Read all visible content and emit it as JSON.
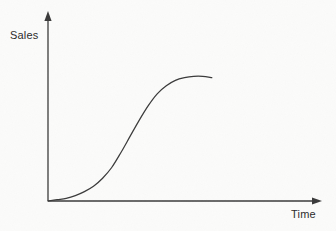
{
  "figure": {
    "background_color": "#fbfbfa",
    "ink_color": "#3a3a3a",
    "text_color": "#2b2b2b"
  },
  "axes": {
    "y": {
      "label": "Sales",
      "arrow_name": "y-axis-arrow"
    },
    "x": {
      "label": "Time",
      "arrow_name": "x-axis-arrow"
    }
  },
  "chart_data": {
    "type": "line",
    "title": "",
    "xlabel": "Time",
    "ylabel": "Sales",
    "xlim": [
      0,
      100
    ],
    "ylim": [
      0,
      100
    ],
    "grid": false,
    "legend": false,
    "axis_ticks": {
      "x": [],
      "y": []
    },
    "annotations": [],
    "series": [
      {
        "name": "Sales over time (S-curve / product life cycle)",
        "x": [
          0,
          5,
          10,
          15,
          20,
          25,
          30,
          35,
          40,
          45,
          50,
          55,
          60,
          65,
          70,
          75,
          80,
          85,
          90
        ],
        "values": [
          0,
          1,
          2,
          4,
          7,
          11,
          17,
          25,
          36,
          48,
          60,
          71,
          80,
          86,
          90,
          92,
          93,
          93,
          92
        ]
      }
    ]
  }
}
